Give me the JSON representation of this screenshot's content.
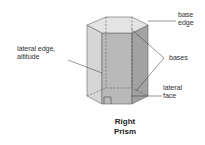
{
  "diagram": {
    "title_line1": "Right",
    "title_line2": "Prism",
    "labels": {
      "base_edge_1": "base",
      "base_edge_2": "edge",
      "lateral_edge_1": "lateral edge,",
      "lateral_edge_2": "altitude",
      "bases": "bases",
      "lateral_face_1": "lateral",
      "lateral_face_2": "face"
    },
    "colors": {
      "top_face": "#e4e4e4",
      "left_face": "#d6d6d6",
      "front_face": "#b9b9b9",
      "right_face": "#a2a2a2",
      "edge": "#555555"
    }
  }
}
